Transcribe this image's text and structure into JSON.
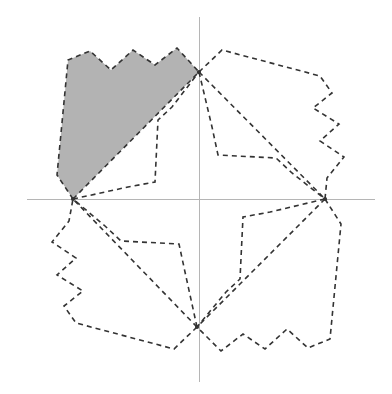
{
  "figure": {
    "width": 392,
    "height": 394,
    "background_color": "#ffffff"
  },
  "colors": {
    "background": "#ffffff",
    "axis": "#b5b5b5",
    "outline": "#333333",
    "shaded_fill": "#b3b3b3",
    "shaded_stroke": "#333333"
  },
  "axes": {
    "origin": {
      "x": 199,
      "y": 199
    },
    "x_axis": {
      "label": "x-axis",
      "x1": 27,
      "y1": 199,
      "x2": 375,
      "y2": 199
    },
    "y_axis": {
      "label": "y-axis",
      "x1": 199,
      "y1": 17,
      "x2": 199,
      "y2": 382
    },
    "stroke_width": 1
  },
  "hubs": [
    {
      "name": "top-hub",
      "x": 199,
      "y": 72
    },
    {
      "name": "right-hub",
      "x": 325,
      "y": 199
    },
    {
      "name": "bottom-hub",
      "x": 197,
      "y": 327
    },
    {
      "name": "left-hub",
      "x": 73,
      "y": 199
    }
  ],
  "dash_pattern": "5 4",
  "stroke_width": 1.6,
  "chart_data": {
    "type": "scatter",
    "xlabel": "",
    "ylabel": "",
    "grid": false,
    "legend": "none",
    "quadrants": [
      {
        "name": "upper-left-quadrant",
        "shaded": true,
        "outer_flap": [
          [
            73,
            199
          ],
          [
            57,
            175
          ],
          [
            68,
            60
          ],
          [
            90,
            51
          ],
          [
            111,
            70
          ],
          [
            133,
            50
          ],
          [
            155,
            65
          ],
          [
            177,
            48
          ],
          [
            199,
            72
          ]
        ],
        "inner_crease": [
          [
            73,
            199
          ],
          [
            199,
            72
          ]
        ],
        "inner_flap": [
          [
            73,
            199
          ],
          [
            128,
            187
          ],
          [
            155,
            182
          ],
          [
            158,
            120
          ],
          [
            172,
            107
          ],
          [
            199,
            72
          ]
        ]
      },
      {
        "name": "upper-right-quadrant",
        "shaded": false,
        "outer_flap": [
          [
            199,
            72
          ],
          [
            222,
            50
          ],
          [
            320,
            76
          ],
          [
            332,
            93
          ],
          [
            313,
            108
          ],
          [
            339,
            124
          ],
          [
            320,
            141
          ],
          [
            344,
            157
          ],
          [
            327,
            178
          ],
          [
            325,
            199
          ]
        ],
        "inner_crease": [
          [
            199,
            72
          ],
          [
            325,
            199
          ]
        ],
        "inner_flap": [
          [
            199,
            72
          ],
          [
            212,
            127
          ],
          [
            218,
            155
          ],
          [
            276,
            158
          ],
          [
            292,
            173
          ],
          [
            325,
            199
          ]
        ]
      },
      {
        "name": "lower-right-quadrant",
        "shaded": false,
        "outer_flap": [
          [
            325,
            199
          ],
          [
            341,
            224
          ],
          [
            330,
            339
          ],
          [
            308,
            348
          ],
          [
            287,
            329
          ],
          [
            265,
            349
          ],
          [
            243,
            334
          ],
          [
            221,
            351
          ],
          [
            197,
            327
          ]
        ],
        "inner_crease": [
          [
            325,
            199
          ],
          [
            197,
            327
          ]
        ],
        "inner_flap": [
          [
            325,
            199
          ],
          [
            270,
            212
          ],
          [
            243,
            217
          ],
          [
            240,
            279
          ],
          [
            226,
            292
          ],
          [
            197,
            327
          ]
        ]
      },
      {
        "name": "lower-left-quadrant",
        "shaded": false,
        "outer_flap": [
          [
            197,
            327
          ],
          [
            174,
            349
          ],
          [
            76,
            323
          ],
          [
            64,
            306
          ],
          [
            83,
            291
          ],
          [
            57,
            275
          ],
          [
            76,
            258
          ],
          [
            52,
            242
          ],
          [
            69,
            221
          ],
          [
            73,
            199
          ]
        ],
        "inner_crease": [
          [
            197,
            327
          ],
          [
            73,
            199
          ]
        ],
        "inner_flap": [
          [
            197,
            327
          ],
          [
            185,
            272
          ],
          [
            179,
            244
          ],
          [
            121,
            241
          ],
          [
            105,
            226
          ],
          [
            73,
            199
          ]
        ]
      }
    ]
  }
}
